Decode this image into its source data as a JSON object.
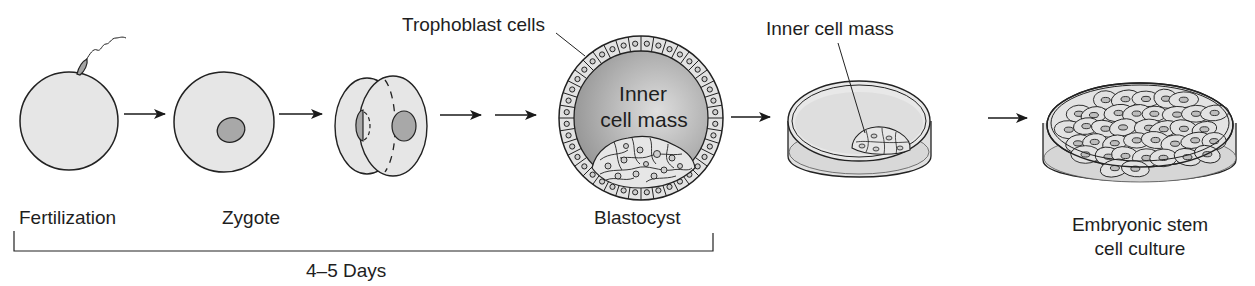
{
  "diagram": {
    "type": "process-flow",
    "stages": [
      {
        "id": "fertilization",
        "label": "Fertilization"
      },
      {
        "id": "zygote",
        "label": "Zygote"
      },
      {
        "id": "two-cell",
        "label": ""
      },
      {
        "id": "blastocyst",
        "label": "Blastocyst"
      },
      {
        "id": "dish-icm",
        "label": ""
      },
      {
        "id": "culture",
        "label": "Embryonic stem cell culture"
      }
    ],
    "callouts": {
      "trophoblast": "Trophoblast cells",
      "inner_cell_mass_inside_line1": "Inner",
      "inner_cell_mass_inside_line2": "cell mass",
      "inner_cell_mass_dish": "Inner cell mass"
    },
    "labels": {
      "fertilization": "Fertilization",
      "zygote": "Zygote",
      "blastocyst": "Blastocyst",
      "culture_line1": "Embryonic stem",
      "culture_line2": "cell culture"
    },
    "timespan": {
      "label": "4–5 Days",
      "from": "Fertilization",
      "to": "Blastocyst"
    },
    "colors": {
      "cell_fill": "#e6e6e6",
      "nucleus_fill": "#a8a8a8",
      "stroke": "#222222",
      "blastocoel_dark": "#8f8f8f",
      "blastocoel_light": "#dcdcdc"
    }
  }
}
